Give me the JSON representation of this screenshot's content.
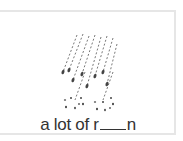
{
  "card": {
    "illustration": "rain-icon",
    "caption": {
      "prefix": "a lot of r",
      "blank": "___",
      "suffix": "n"
    }
  },
  "colors": {
    "border": "#e6e6e6",
    "ink": "#333333"
  }
}
